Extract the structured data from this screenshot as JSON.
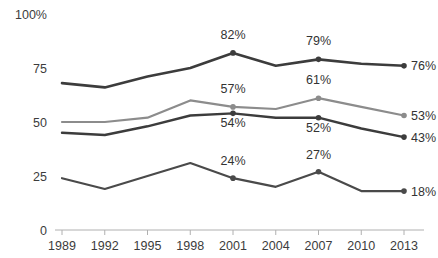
{
  "title": "",
  "chart_data": {
    "type": "line",
    "title": "",
    "xlabel": "",
    "ylabel": "",
    "grid": false,
    "legend": "none",
    "categories": [
      "1989",
      "1992",
      "1995",
      "1998",
      "2001",
      "2004",
      "2007",
      "2010",
      "2013"
    ],
    "ylim": [
      0,
      100
    ],
    "yticks": [
      "0",
      "25",
      "50",
      "75",
      "100%"
    ],
    "ytick_values": [
      0,
      25,
      50,
      75,
      100
    ],
    "series": [
      {
        "name": "series-1",
        "color": "#3c3c3c",
        "width": 2.6,
        "values": [
          68,
          66,
          71,
          75,
          82,
          76,
          79,
          77,
          76
        ],
        "labels": [
          {
            "index": 4,
            "text": "82%"
          },
          {
            "index": 6,
            "text": "79%"
          },
          {
            "index": 8,
            "text": "76%"
          }
        ],
        "markers": [
          4,
          6,
          8
        ],
        "end_label": "76%"
      },
      {
        "name": "series-2",
        "color": "#8c8c8c",
        "width": 2.2,
        "values": [
          50,
          50,
          52,
          60,
          57,
          56,
          61,
          57,
          53
        ],
        "labels": [
          {
            "index": 4,
            "text": "57%"
          },
          {
            "index": 6,
            "text": "61%"
          },
          {
            "index": 8,
            "text": "53%"
          }
        ],
        "markers": [
          4,
          6,
          8
        ],
        "end_label": "53%"
      },
      {
        "name": "series-3",
        "color": "#3c3c3c",
        "width": 2.4,
        "values": [
          45,
          44,
          48,
          53,
          54,
          52,
          52,
          47,
          43
        ],
        "labels": [
          {
            "index": 4,
            "text": "54%"
          },
          {
            "index": 6,
            "text": "52%"
          },
          {
            "index": 8,
            "text": "43%"
          }
        ],
        "markers": [
          4,
          6,
          8
        ],
        "end_label": "43%"
      },
      {
        "name": "series-4",
        "color": "#4a4a4a",
        "width": 2.2,
        "values": [
          24,
          19,
          25,
          31,
          24,
          20,
          27,
          18,
          18
        ],
        "labels": [
          {
            "index": 4,
            "text": "24%"
          },
          {
            "index": 6,
            "text": "27%"
          },
          {
            "index": 8,
            "text": "18%"
          }
        ],
        "markers": [
          4,
          6,
          8
        ],
        "end_label": "18%"
      }
    ],
    "label_offsets": {
      "series-1": [
        -14,
        -14,
        0
      ],
      "series-2": [
        -14,
        -14,
        0
      ],
      "series-3": [
        14,
        14,
        0
      ],
      "series-4": [
        -13,
        -13,
        0
      ]
    },
    "axis_color": "#b0b0b0"
  }
}
